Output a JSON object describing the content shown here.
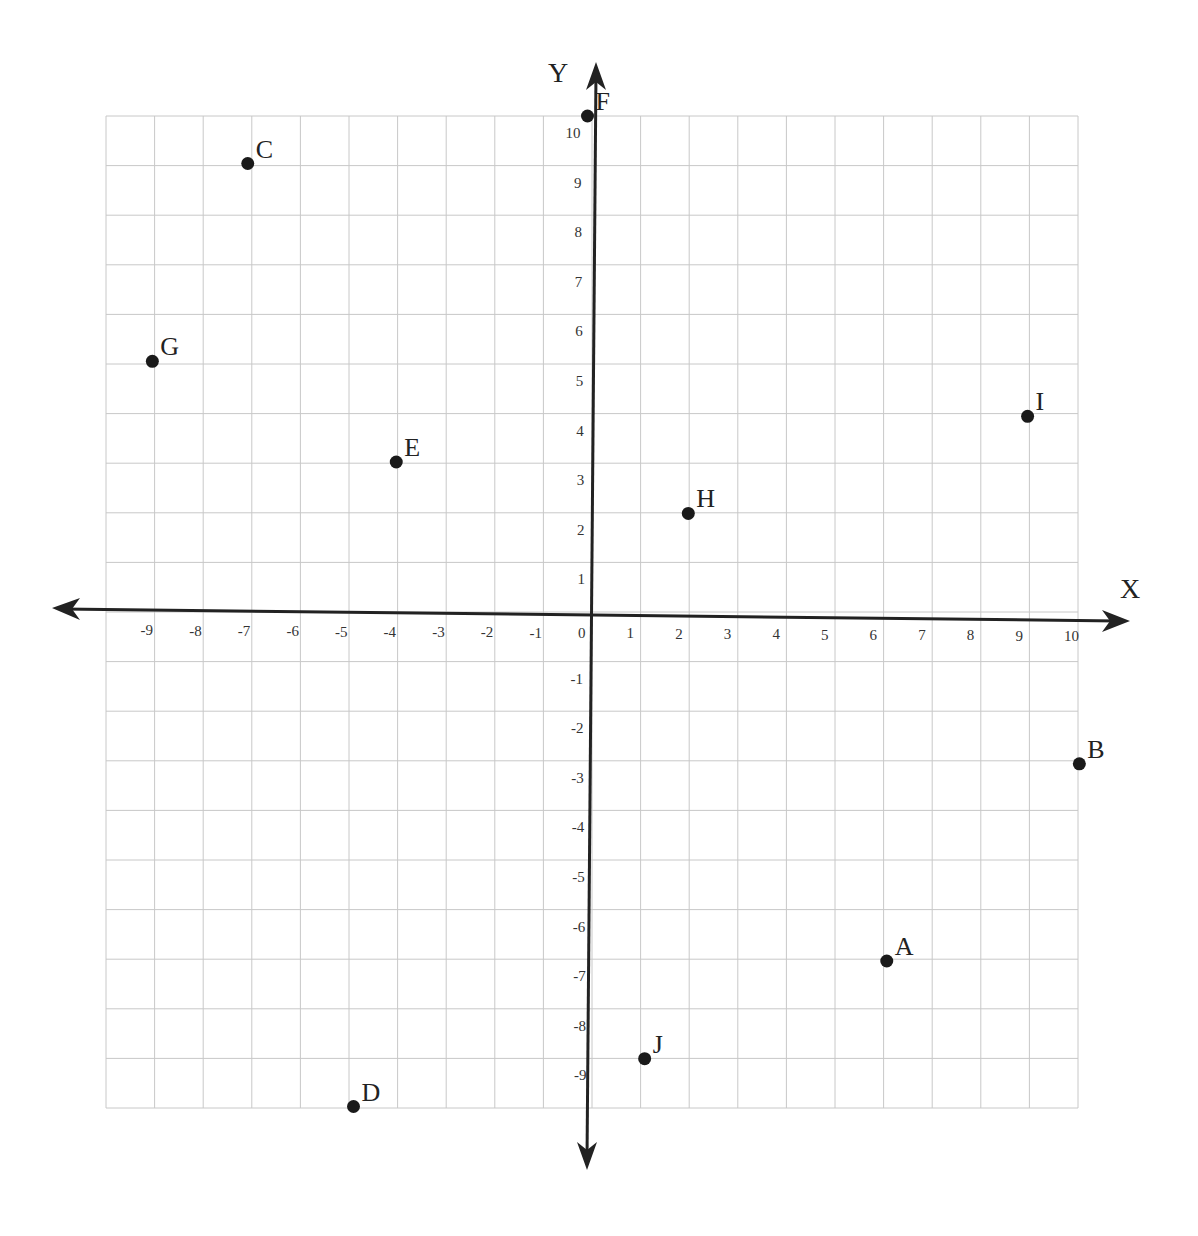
{
  "chart_data": {
    "type": "scatter",
    "title": "",
    "xlabel": "X",
    "ylabel": "Y",
    "xlim": [
      -10,
      10
    ],
    "ylim": [
      -10,
      10
    ],
    "grid": true,
    "legend": null,
    "x_ticks": [
      "-9",
      "-8",
      "-7",
      "-6",
      "-5",
      "-4",
      "-3",
      "-2",
      "-1",
      "0",
      "1",
      "2",
      "3",
      "4",
      "5",
      "6",
      "7",
      "8",
      "9",
      "10"
    ],
    "y_ticks": [
      "10",
      "9",
      "8",
      "7",
      "6",
      "5",
      "4",
      "3",
      "2",
      "1",
      "-1",
      "-2",
      "-3",
      "-4",
      "-5",
      "-6",
      "-7",
      "-8",
      "-9"
    ],
    "points": [
      {
        "label": "A",
        "x": 6,
        "y": -7
      },
      {
        "label": "B",
        "x": 10,
        "y": -3
      },
      {
        "label": "C",
        "x": -7,
        "y": 9
      },
      {
        "label": "D",
        "x": -5,
        "y": -10
      },
      {
        "label": "E",
        "x": -4,
        "y": 3
      },
      {
        "label": "F",
        "x": 0,
        "y": 10
      },
      {
        "label": "G",
        "x": -9,
        "y": 5
      },
      {
        "label": "H",
        "x": 2,
        "y": 2
      },
      {
        "label": "I",
        "x": 9,
        "y": 4
      },
      {
        "label": "J",
        "x": 1,
        "y": -9
      }
    ]
  },
  "colors": {
    "grid": "#c8c8c8",
    "axis": "#222222",
    "point": "#1a1a1a"
  }
}
